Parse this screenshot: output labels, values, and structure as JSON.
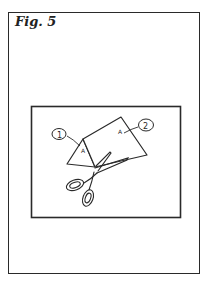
{
  "figure": {
    "label": "Fig. 5",
    "callouts": [
      {
        "id": 1,
        "text": "1",
        "marker": "A"
      },
      {
        "id": 2,
        "text": "2",
        "marker": "A"
      }
    ],
    "colors": {
      "ink": "#2a2a2a",
      "paper": "#ffffff"
    }
  }
}
